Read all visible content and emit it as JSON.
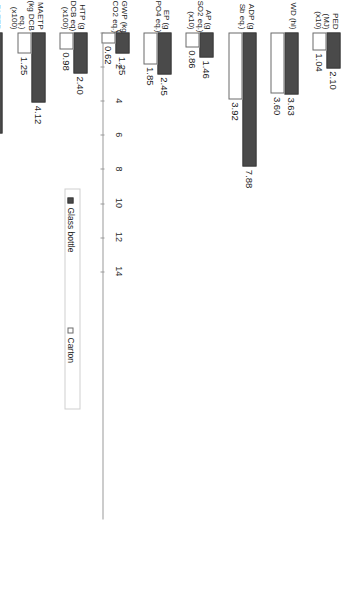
{
  "chart_data": {
    "type": "bar",
    "orientation": "horizontal",
    "title": "",
    "xlabel": "",
    "ylabel": "",
    "xlim": [
      0,
      14
    ],
    "grid": false,
    "legend_position": "right",
    "tick_labels": [
      "0",
      "2",
      "4",
      "6",
      "8",
      "10",
      "12",
      "14"
    ],
    "tick_values": [
      0,
      2,
      4,
      6,
      8,
      10,
      12,
      14
    ],
    "categories": [
      "PED (MJ) (x10)",
      "WD (hl)",
      "ADP (g Sb eq.)",
      "AP (g SO2 eq.) (x10)",
      "EP (g PO4 eq.)",
      "GWP (kg CO2 eq.)",
      "HTP (g DCB eq) (x100)",
      "MAETP (kg DCB eq.) (x100)",
      "FAETP (g DCB eq.) (x10)",
      "TETP (g DCB eq.)",
      "ODP (µg R-11 eq.) (x10)",
      "POCP (g C2H4 eq.)"
    ],
    "category_lines": [
      [
        "PED",
        "(MJ)",
        "(x10)"
      ],
      [
        "WD (hl)"
      ],
      [
        "ADP (g",
        "Sb eq.)"
      ],
      [
        "AP (g",
        "SO2 eq.)",
        "(x10)"
      ],
      [
        "EP (g",
        "PO4 eq.)"
      ],
      [
        "GWP (kg",
        "CO2 eq.)"
      ],
      [
        "HTP (g",
        "DCB eq)",
        "(x100)"
      ],
      [
        "MAETP",
        "(kg DCB",
        "eq.)",
        "(x100)"
      ],
      [
        "FAETP",
        "(g DCB",
        "eq.)",
        "(x10)"
      ],
      [
        "TETP (g",
        "DCB eq.)"
      ],
      [
        "ODP (µg",
        "R-11",
        "eq.)",
        "(x10)"
      ],
      [
        "POCP (g",
        "C2H4",
        "eq.)"
      ]
    ],
    "series": [
      {
        "name": "Glass bottle",
        "color": "#4a4a4a",
        "values": [
          2.1,
          3.63,
          7.88,
          1.46,
          2.45,
          1.25,
          2.4,
          4.12,
          5.95,
          5.24,
          12.0,
          1.01
        ],
        "labels": [
          "2.10",
          "3.63",
          "7.88",
          "1.46",
          "2.45",
          "1.25",
          "2.40",
          "4.12",
          "5.95",
          "5.24",
          "12.00",
          "1.01"
        ]
      },
      {
        "name": "Carton",
        "color": "#ffffff",
        "values": [
          1.04,
          3.6,
          3.92,
          0.86,
          1.85,
          0.62,
          0.98,
          1.25,
          2.22,
          3.29,
          6.23,
          0.59
        ],
        "labels": [
          "1.04",
          "3.60",
          "3.92",
          "0.86",
          "1.85",
          "0.62",
          "0.98",
          "1.25",
          "2.22",
          "3.29",
          "6.23",
          "0.59"
        ]
      }
    ]
  },
  "legend": {
    "items": [
      {
        "label": "Glass bottle",
        "style": "dark"
      },
      {
        "label": "Carton",
        "style": "light"
      }
    ]
  }
}
